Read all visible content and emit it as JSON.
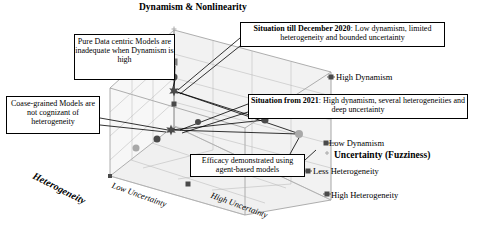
{
  "diagram": {
    "title": "Dynamism & Nonlinearity",
    "type": "3d-conceptual-cube-scatter"
  },
  "axes": {
    "vertical": {
      "title": "Dynamism & Nonlinearity",
      "high_label": "High Dynamism",
      "low_label": "Low Dynamism"
    },
    "depth": {
      "title": "Uncertainty (Fuzziness)",
      "low_label": "Low Uncertainty",
      "high_label": "High Uncertainty"
    },
    "horizontal": {
      "title": "Heterogeneity",
      "less_label": "Less Heterogeneity",
      "high_label": "High Heterogeneity"
    }
  },
  "callouts": {
    "pure_data": "Pure Data centric Models are inadequate when Dynamism is high",
    "coarse_grained": "Coase-grained Models are not cognizant of heterogeneity",
    "efficacy": "Efficacy demonstrated using agent-based models",
    "situation_2020_bold": "Situation till December 2020",
    "situation_2020_rest": ": Low dynamism, limited heterogeneity and bounded uncertainty",
    "situation_2021_bold": "Situation from 2021",
    "situation_2021_rest": ": High dynamism, several heterogeneities and deep uncertainty"
  },
  "colors": {
    "line": "#9a9a9a",
    "marker_dark": "#4a4a4a",
    "marker_mid": "#7d7d7d",
    "marker_light": "#a8a8a8",
    "face": "#e8e8e8",
    "text": "#000000",
    "box_border": "#000000"
  },
  "markers": [
    {
      "id": "m1",
      "x": 174,
      "y": 62,
      "shape": "square",
      "tone": "mid",
      "size": 7
    },
    {
      "id": "m2",
      "x": 174,
      "y": 77,
      "shape": "circle",
      "tone": "dark",
      "size": 7
    },
    {
      "id": "m3",
      "x": 174,
      "y": 91,
      "shape": "star",
      "tone": "dark",
      "size": 11
    },
    {
      "id": "m4",
      "x": 174,
      "y": 104,
      "shape": "square",
      "tone": "dark",
      "size": 5
    },
    {
      "id": "m5",
      "x": 171,
      "y": 130,
      "shape": "star",
      "tone": "dark",
      "size": 11
    },
    {
      "id": "m6",
      "x": 157,
      "y": 139,
      "shape": "circle",
      "tone": "dark",
      "size": 7
    },
    {
      "id": "m7",
      "x": 136,
      "y": 148,
      "shape": "circle",
      "tone": "light",
      "size": 7
    },
    {
      "id": "m8",
      "x": 198,
      "y": 122,
      "shape": "circle",
      "tone": "dark",
      "size": 6
    },
    {
      "id": "m9",
      "x": 265,
      "y": 120,
      "shape": "circle",
      "tone": "dark",
      "size": 7
    },
    {
      "id": "m10",
      "x": 299,
      "y": 134,
      "shape": "circle",
      "tone": "light",
      "size": 8
    },
    {
      "id": "m11",
      "x": 331,
      "y": 77,
      "shape": "square",
      "tone": "dark",
      "size": 5
    },
    {
      "id": "m12",
      "x": 326,
      "y": 143,
      "shape": "square",
      "tone": "dark",
      "size": 5
    },
    {
      "id": "m13",
      "x": 327,
      "y": 194,
      "shape": "square",
      "tone": "dark",
      "size": 5
    },
    {
      "id": "m14",
      "x": 308,
      "y": 171,
      "shape": "square",
      "tone": "dark",
      "size": 5
    },
    {
      "id": "m15",
      "x": 188,
      "y": 184,
      "shape": "square",
      "tone": "dark",
      "size": 5
    },
    {
      "id": "m16",
      "x": 110,
      "y": 176,
      "shape": "square",
      "tone": "dark",
      "size": 4
    },
    {
      "id": "m17",
      "x": 174,
      "y": 29,
      "shape": "cross",
      "tone": "light",
      "size": 5
    },
    {
      "id": "m18",
      "x": 327,
      "y": 153,
      "shape": "cross",
      "tone": "light",
      "size": 4
    }
  ]
}
